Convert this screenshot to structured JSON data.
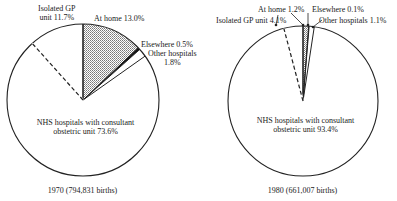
{
  "chart_data": [
    {
      "type": "pie",
      "title": "1970 (794,831 births)",
      "year": "1970",
      "births": "794,831",
      "slices": [
        {
          "label": "At home",
          "value": 13.0,
          "style": "cross-hatched"
        },
        {
          "label": "Elsewhere",
          "value": 0.5,
          "style": "solid black"
        },
        {
          "label": "Other hospitals",
          "value": 1.8,
          "style": "white"
        },
        {
          "label": "NHS hospitals with consultant obstetric unit",
          "value": 73.6,
          "style": "white"
        },
        {
          "label": "Isolated GP unit",
          "value": 11.7,
          "style": "white, dashed boundary"
        }
      ]
    },
    {
      "type": "pie",
      "title": "1980 (661,007 births)",
      "year": "1980",
      "births": "661,007",
      "slices": [
        {
          "label": "At home",
          "value": 1.2,
          "style": "cross-hatched"
        },
        {
          "label": "Elsewhere",
          "value": 0.1,
          "style": "solid black"
        },
        {
          "label": "Other hospitals",
          "value": 1.1,
          "style": "white"
        },
        {
          "label": "NHS hospitals with consultant obstetric unit",
          "value": 93.4,
          "style": "white"
        },
        {
          "label": "Isolated GP unit",
          "value": 4.1,
          "style": "white, dashed boundary"
        }
      ]
    }
  ],
  "labels": {
    "p1": {
      "gp1": "Isolated GP",
      "gp2": "unit 11.7%",
      "home": "At home 13.0%",
      "else": "Elsewhere 0.5%",
      "other1": "Other hospitals",
      "other2": "1.8%",
      "nhs1": "NHS hospitals with consultant",
      "nhs2": "obstetric unit 73.6%",
      "caption": "1970 (794,831 births)"
    },
    "p2": {
      "home": "At home 1.2%",
      "else": "Elsewhere 0.1%",
      "gp": "Isolated GP unit 4.1%",
      "other": "Other hospitals 1.1%",
      "nhs1": "NHS hospitals with consultant",
      "nhs2": "obstetric unit 93.4%",
      "caption": "1980 (661,007 births)"
    }
  }
}
